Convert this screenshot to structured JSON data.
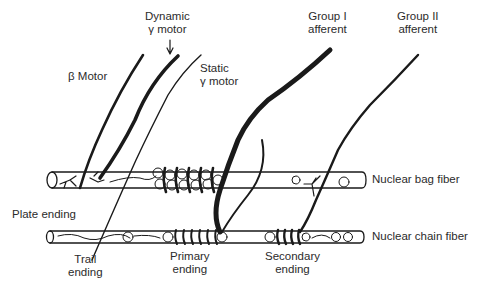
{
  "diagram": {
    "labels": {
      "dynamic_gamma_line1": "Dynamic",
      "dynamic_gamma_line2": "γ motor",
      "beta_motor": "β Motor",
      "static_gamma_line1": "Static",
      "static_gamma_line2": "γ motor",
      "group1_line1": "Group I",
      "group1_line2": "afferent",
      "group2_line1": "Group II",
      "group2_line2": "afferent",
      "nuclear_bag": "Nuclear bag fiber",
      "nuclear_chain": "Nuclear chain fiber",
      "plate_ending": "Plate ending",
      "trail_line1": "Trail",
      "trail_line2": "ending",
      "primary_line1": "Primary",
      "primary_line2": "ending",
      "secondary_line1": "Secondary",
      "secondary_line2": "ending"
    },
    "colors": {
      "ink": "#1a1a1a",
      "text": "#2b2b2b",
      "background": "#ffffff"
    }
  }
}
